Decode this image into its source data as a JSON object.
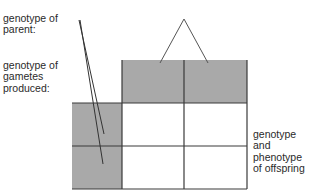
{
  "diagram": {
    "type": "punnett-square-template",
    "labels": {
      "parent": [
        "genotype of",
        "parent:"
      ],
      "gametes": [
        "genotype of",
        "gametes",
        "produced:"
      ],
      "offspring": [
        "genotype",
        "and",
        "phenotype",
        "of offspring"
      ]
    },
    "grid": {
      "rows": 2,
      "cols": 2,
      "header_row_cells": 2,
      "header_col_cells": 2,
      "offspring_cells": 4
    },
    "colors": {
      "shaded": "#a9a9a9",
      "line": "#3a3a3a",
      "text": "#2a2a2a",
      "background": "#ffffff"
    }
  }
}
